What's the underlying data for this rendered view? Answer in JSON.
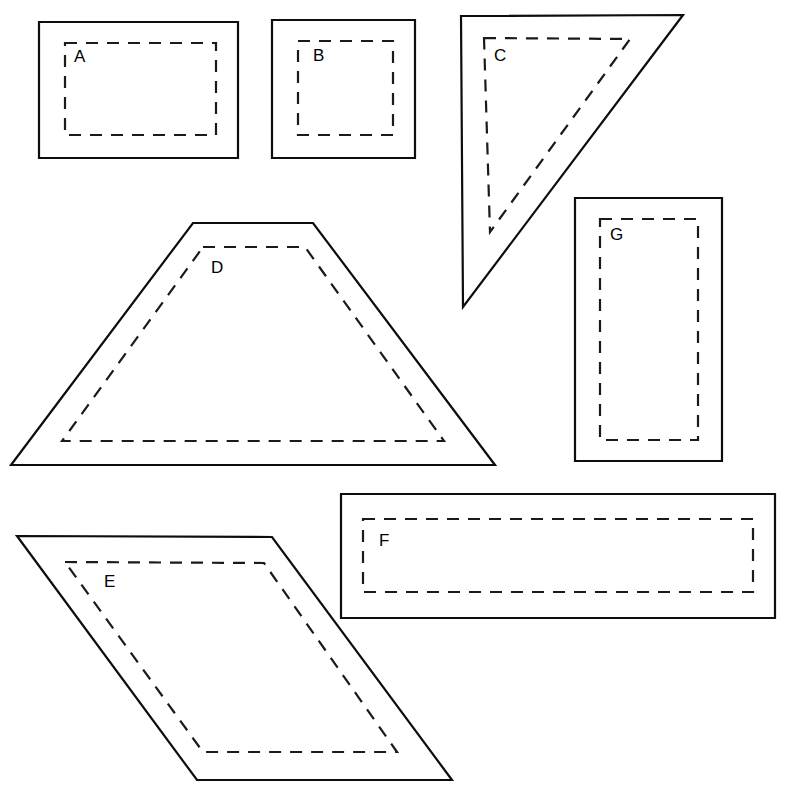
{
  "canvas": {
    "width": 789,
    "height": 796,
    "background": "#ffffff",
    "outline_color": "#0d0d0d",
    "inset_color": "#1a1a1a",
    "label_color": "#000000"
  },
  "shapes": [
    {
      "id": "A",
      "label": "A",
      "kind": "rectangle",
      "outline_points": "39,22 238,22 238,158 39,158",
      "inset_points": "65,43 216,43 216,135 65,135",
      "label_x": 74,
      "label_y": 58
    },
    {
      "id": "B",
      "label": "B",
      "kind": "square",
      "outline_points": "272,20 415,20 415,158 272,158",
      "inset_points": "298,41 393,41 393,135 298,135",
      "label_x": 313,
      "label_y": 57
    },
    {
      "id": "C",
      "label": "C",
      "kind": "triangle",
      "outline_points": "461,16 683,15 463,307",
      "inset_points": "484,38 630,39 490,232",
      "label_x": 494,
      "label_y": 57
    },
    {
      "id": "D",
      "label": "D",
      "kind": "trapezoid",
      "outline_points": "193,223 313,223 495,465 11,465",
      "inset_points": "203,247 305,247 444,441 62,441",
      "label_x": 211,
      "label_y": 269
    },
    {
      "id": "E",
      "label": "E",
      "kind": "parallelogram",
      "outline_points": "17,536 272,537 452,780 197,780",
      "inset_points": "65,562 264,563 397,752 203,752",
      "label_x": 104,
      "label_y": 583
    },
    {
      "id": "F",
      "label": "F",
      "kind": "rectangle",
      "outline_points": "341,494 775,494 775,618 341,618",
      "inset_points": "363,519 753,519 753,592 363,592",
      "label_x": 379,
      "label_y": 542
    },
    {
      "id": "G",
      "label": "G",
      "kind": "rectangle",
      "outline_points": "575,198 722,198 722,461 575,461",
      "inset_points": "600,219 698,219 698,440 600,440",
      "label_x": 610,
      "label_y": 236
    }
  ]
}
